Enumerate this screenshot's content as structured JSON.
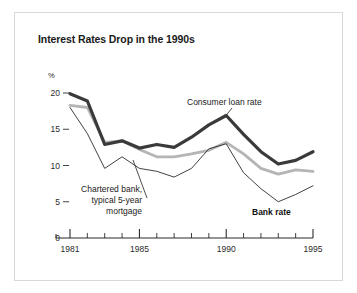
{
  "figure": {
    "title": "Interest Rates Drop in the 1990s",
    "unit_label": "%",
    "border_color": "#d8d8d8",
    "background": "#ffffff"
  },
  "annotations": {
    "consumer": "Consumer loan rate",
    "mortgage_line1": "Chartered bank,",
    "mortgage_line2": "typical 5-year",
    "mortgage_line3": "mortgage",
    "bank": "Bank rate"
  },
  "axis": {
    "y_ticks": [
      "20",
      "15",
      "10",
      "5",
      "0"
    ],
    "x_major_ticks": [
      "1981",
      "1985",
      "1990",
      "1995"
    ]
  },
  "chart_data": {
    "type": "line",
    "title": "Interest Rates Drop in the 1990s",
    "xlabel": "",
    "ylabel": "%",
    "xlim": [
      1980.5,
      1995
    ],
    "ylim": [
      0,
      21.5
    ],
    "yticks": [
      0,
      5,
      10,
      15,
      20
    ],
    "xticks": [
      1981,
      1982,
      1983,
      1984,
      1985,
      1986,
      1987,
      1988,
      1989,
      1990,
      1991,
      1992,
      1993,
      1994,
      1995
    ],
    "x_major_ticks": [
      1981,
      1985,
      1990,
      1995
    ],
    "grid": false,
    "legend": "annotated-inline",
    "x": [
      1981,
      1982,
      1983,
      1984,
      1985,
      1986,
      1987,
      1988,
      1989,
      1990,
      1991,
      1992,
      1993,
      1994,
      1995
    ],
    "series": [
      {
        "name": "Consumer loan rate",
        "color": "#3a3a3a",
        "width": 3.2,
        "values": [
          19.9,
          18.9,
          12.9,
          13.4,
          12.4,
          12.9,
          12.5,
          13.9,
          15.6,
          16.9,
          14.3,
          11.9,
          10.2,
          10.7,
          11.9
        ]
      },
      {
        "name": "Chartered bank, typical 5-year mortgage",
        "color": "#b5b5b5",
        "width": 2.8,
        "values": [
          18.3,
          18.0,
          13.2,
          13.4,
          12.2,
          11.2,
          11.2,
          11.6,
          12.1,
          13.2,
          11.6,
          9.6,
          8.8,
          9.4,
          9.2
        ]
      },
      {
        "name": "Bank rate",
        "color": "#2b2b2b",
        "width": 0.9,
        "values": [
          18.0,
          14.4,
          9.6,
          11.2,
          9.6,
          9.2,
          8.4,
          9.6,
          12.3,
          13.0,
          9.0,
          6.8,
          5.0,
          6.0,
          7.2
        ]
      }
    ]
  }
}
